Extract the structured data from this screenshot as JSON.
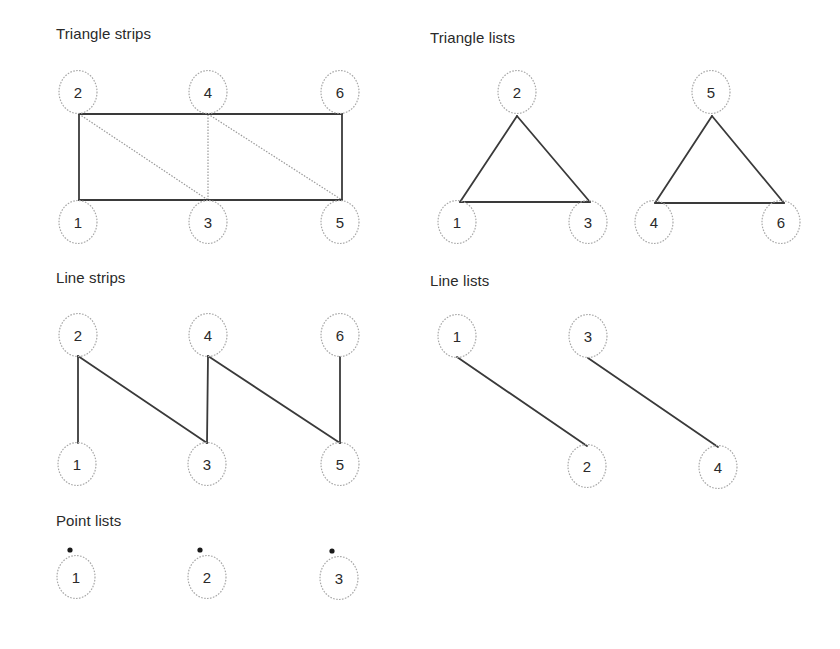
{
  "sections": {
    "triangle_strips": {
      "title": "Triangle strips",
      "vertices": [
        {
          "label": "1",
          "cx": 78,
          "cy": 222,
          "ax": 79,
          "ay": 200
        },
        {
          "label": "2",
          "cx": 78,
          "cy": 92,
          "ax": 79,
          "ay": 114
        },
        {
          "label": "3",
          "cx": 208,
          "cy": 222,
          "ax": 208,
          "ay": 200
        },
        {
          "label": "4",
          "cx": 208,
          "cy": 92,
          "ax": 208,
          "ay": 114
        },
        {
          "label": "5",
          "cx": 340,
          "cy": 222,
          "ax": 342,
          "ay": 200
        },
        {
          "label": "6",
          "cx": 340,
          "cy": 92,
          "ax": 342,
          "ay": 114
        }
      ],
      "solid_edges": [
        [
          0,
          1
        ],
        [
          1,
          3
        ],
        [
          3,
          5
        ],
        [
          5,
          4
        ],
        [
          4,
          2
        ],
        [
          2,
          0
        ]
      ],
      "dotted_edges": [
        [
          1,
          2
        ],
        [
          2,
          3
        ],
        [
          3,
          4
        ]
      ]
    },
    "triangle_lists": {
      "title": "Triangle lists",
      "vertices": [
        {
          "label": "1",
          "cx": 457,
          "cy": 222,
          "ax": 460,
          "ay": 202
        },
        {
          "label": "2",
          "cx": 517,
          "cy": 92,
          "ax": 517,
          "ay": 116
        },
        {
          "label": "3",
          "cx": 588,
          "cy": 222,
          "ax": 590,
          "ay": 202
        },
        {
          "label": "4",
          "cx": 654,
          "cy": 222,
          "ax": 655,
          "ay": 203
        },
        {
          "label": "5",
          "cx": 711,
          "cy": 92,
          "ax": 712,
          "ay": 116
        },
        {
          "label": "6",
          "cx": 781,
          "cy": 222,
          "ax": 784,
          "ay": 203
        }
      ],
      "solid_edges": [
        [
          0,
          1
        ],
        [
          1,
          2
        ],
        [
          2,
          0
        ],
        [
          3,
          4
        ],
        [
          4,
          5
        ],
        [
          5,
          3
        ]
      ],
      "dotted_edges": []
    },
    "line_strips": {
      "title": "Line strips",
      "vertices": [
        {
          "label": "1",
          "cx": 77,
          "cy": 464,
          "ax": 78,
          "ay": 443
        },
        {
          "label": "2",
          "cx": 78,
          "cy": 335,
          "ax": 78,
          "ay": 356
        },
        {
          "label": "3",
          "cx": 207,
          "cy": 464,
          "ax": 207,
          "ay": 443
        },
        {
          "label": "4",
          "cx": 208,
          "cy": 335,
          "ax": 208,
          "ay": 356
        },
        {
          "label": "5",
          "cx": 340,
          "cy": 464,
          "ax": 340,
          "ay": 443
        },
        {
          "label": "6",
          "cx": 340,
          "cy": 335,
          "ax": 340,
          "ay": 357
        }
      ],
      "solid_edges": [
        [
          0,
          1
        ],
        [
          1,
          2
        ],
        [
          2,
          3
        ],
        [
          3,
          4
        ],
        [
          4,
          5
        ]
      ],
      "dotted_edges": []
    },
    "line_lists": {
      "title": "Line lists",
      "vertices": [
        {
          "label": "1",
          "cx": 457,
          "cy": 336,
          "ax": 457,
          "ay": 357
        },
        {
          "label": "2",
          "cx": 587,
          "cy": 466,
          "ax": 587,
          "ay": 446
        },
        {
          "label": "3",
          "cx": 588,
          "cy": 336,
          "ax": 588,
          "ay": 358
        },
        {
          "label": "4",
          "cx": 718,
          "cy": 467,
          "ax": 718,
          "ay": 447
        }
      ],
      "solid_edges": [
        [
          0,
          1
        ],
        [
          2,
          3
        ]
      ],
      "dotted_edges": []
    },
    "point_lists": {
      "title": "Point lists",
      "vertices": [
        {
          "label": "1",
          "cx": 76,
          "cy": 577,
          "ax": 70,
          "ay": 550
        },
        {
          "label": "2",
          "cx": 207,
          "cy": 577,
          "ax": 200,
          "ay": 550
        },
        {
          "label": "3",
          "cx": 339,
          "cy": 578,
          "ax": 332,
          "ay": 551
        }
      ],
      "solid_edges": [],
      "dotted_edges": [],
      "show_points": true
    }
  },
  "style": {
    "edge_color": "#3a3a3a",
    "dotted_edge_color": "#9a9a9a",
    "circle_color": "#a8a8a8",
    "point_color": "#1a1a1a",
    "label_color": "#2a2a2a"
  }
}
